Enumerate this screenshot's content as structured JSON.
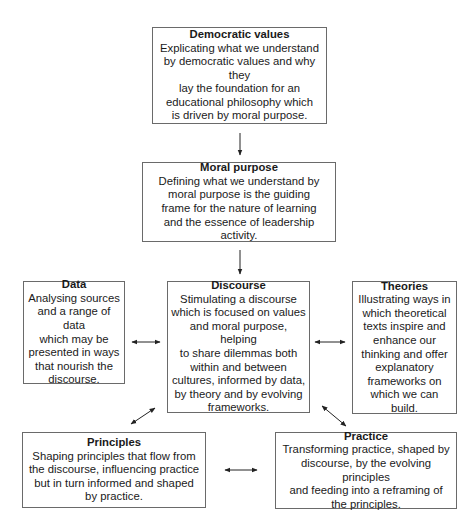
{
  "diagram": {
    "nodes": {
      "democratic_values": {
        "title": "Democratic values",
        "body": "Explicating what we understand\nby democratic values and why they\nlay the foundation for an\neducational philosophy which\nis driven by moral purpose."
      },
      "moral_purpose": {
        "title": "Moral purpose",
        "body": "Defining what we understand by\nmoral purpose is the guiding\nframe for the nature of learning\nand the essence of leadership activity."
      },
      "data": {
        "title": "Data",
        "body": "Analysing sources\nand a range of data\nwhich may be\npresented in ways\nthat nourish the\ndiscourse."
      },
      "discourse": {
        "title": "Discourse",
        "body": "Stimulating a discourse\nwhich is focused on values\nand moral purpose, helping\nto share dilemmas both\nwithin and between\ncultures, informed by data,\nby theory and by evolving\nframeworks."
      },
      "theories": {
        "title": "Theories",
        "body": "Illustrating ways in\nwhich theoretical\ntexts inspire and\nenhance our\nthinking and offer\nexplanatory\nframeworks on\nwhich we can build."
      },
      "principles": {
        "title": "Principles",
        "body": "Shaping principles that flow from\nthe discourse, influencing practice\nbut in turn informed and shaped\nby practice."
      },
      "practice": {
        "title": "Practice",
        "body": "Transforming practice, shaped by\ndiscourse, by the evolving principles\nand feeding into a reframing of\nthe principles."
      }
    },
    "edges": [
      {
        "from": "Democratic values",
        "to": "Moral purpose",
        "type": "one-way"
      },
      {
        "from": "Moral purpose",
        "to": "Discourse",
        "type": "one-way"
      },
      {
        "from": "Data",
        "to": "Discourse",
        "type": "two-way"
      },
      {
        "from": "Discourse",
        "to": "Theories",
        "type": "two-way"
      },
      {
        "from": "Discourse",
        "to": "Principles",
        "type": "two-way"
      },
      {
        "from": "Discourse",
        "to": "Practice",
        "type": "two-way"
      },
      {
        "from": "Principles",
        "to": "Practice",
        "type": "two-way"
      }
    ],
    "colors": {
      "border": "#6a6a6a",
      "arrow": "#222222",
      "text": "#1a1a1a"
    }
  }
}
